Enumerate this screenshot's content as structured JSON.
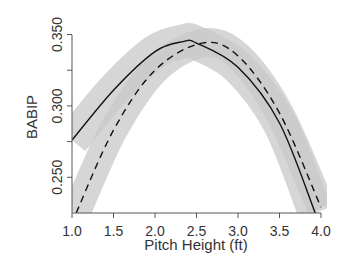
{
  "chart_data": {
    "type": "line",
    "title": "",
    "xlabel": "Pitch Height (ft)",
    "ylabel": "BABIP",
    "xlim": [
      1.0,
      4.0
    ],
    "ylim": [
      0.225,
      0.355
    ],
    "xticks": [
      "1.0",
      "1.5",
      "2.0",
      "2.5",
      "3.0",
      "3.5",
      "4.0"
    ],
    "yticks": [
      "0.250",
      "0.300",
      "0.350"
    ],
    "grid": false,
    "legend": null,
    "series": [
      {
        "name": "solid",
        "style": "solid",
        "x": [
          1.0,
          1.5,
          2.0,
          2.34,
          2.5,
          3.0,
          3.5,
          3.93
        ],
        "values": [
          0.276,
          0.311,
          0.338,
          0.345,
          0.344,
          0.327,
          0.288,
          0.225
        ],
        "band": 0.012
      },
      {
        "name": "dashed",
        "style": "dashed",
        "x": [
          1.05,
          1.5,
          2.0,
          2.57,
          3.0,
          3.5,
          4.0
        ],
        "values": [
          0.225,
          0.283,
          0.325,
          0.344,
          0.335,
          0.295,
          0.229
        ],
        "band": 0.01
      }
    ]
  }
}
